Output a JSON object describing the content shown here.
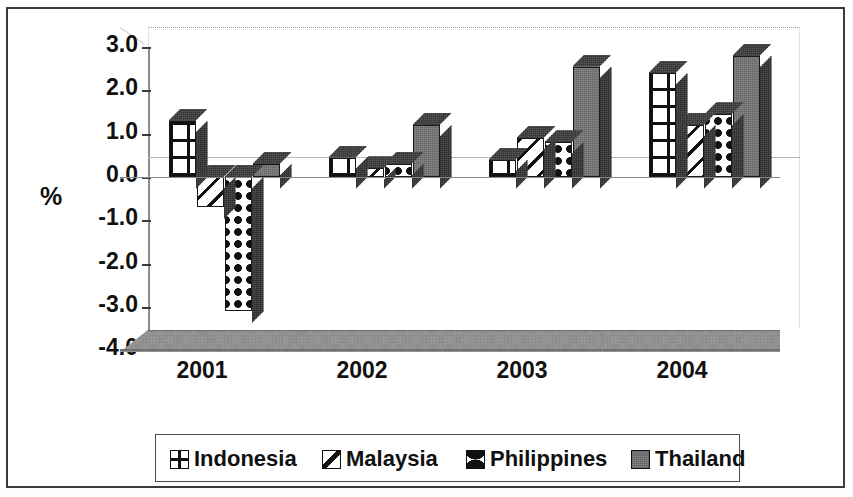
{
  "chart_data": {
    "type": "bar",
    "title": "",
    "subtitle": "",
    "xlabel": "",
    "ylabel": "%",
    "categories": [
      "2001",
      "2002",
      "2003",
      "2004"
    ],
    "series": [
      {
        "name": "Indonesia",
        "pattern": "grid-hatch",
        "values": [
          1.3,
          0.45,
          0.4,
          2.4
        ]
      },
      {
        "name": "Malaysia",
        "pattern": "diagonal-lines",
        "values": [
          -0.7,
          0.2,
          0.9,
          1.2
        ]
      },
      {
        "name": "Philippines",
        "pattern": "wavy-lines",
        "values": [
          -3.1,
          0.3,
          0.8,
          1.45
        ]
      },
      {
        "name": "Thailand",
        "pattern": "solid-gray",
        "values": [
          0.3,
          1.2,
          2.55,
          2.8
        ]
      }
    ],
    "ylim": [
      -4.0,
      3.0
    ],
    "ytick_labels": [
      "3.0",
      "2.0",
      "1.0",
      "0.0",
      "-1.0",
      "-2.0",
      "-3.0",
      "-4.0"
    ],
    "ytick_values": [
      3.0,
      2.0,
      1.0,
      0.0,
      -1.0,
      -2.0,
      -3.0,
      -4.0
    ],
    "grid": false,
    "legend_position": "bottom",
    "style": "3d-perspective",
    "colors": {
      "axis": "#3a3a3a",
      "frame": "#3b3b3b",
      "floor": "#9e9e9e",
      "thailand_fill": "#8e8e8e",
      "bar_outline": "#1a1a1a",
      "text": "#111111"
    }
  },
  "legend": {
    "items": [
      {
        "label": "Indonesia",
        "swatch": "indonesia-grid-swatch"
      },
      {
        "label": "Malaysia",
        "swatch": "malaysia-diagonal-swatch"
      },
      {
        "label": "Philippines",
        "swatch": "philippines-wavy-swatch"
      },
      {
        "label": "Thailand",
        "swatch": "thailand-solid-swatch"
      }
    ]
  }
}
